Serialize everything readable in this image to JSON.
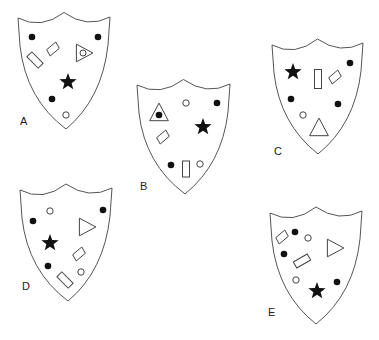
{
  "caption": "",
  "shields": [
    {
      "label": "A",
      "outline": {
        "tl": [
          18,
          18
        ],
        "tr": [
          110,
          17
        ],
        "tip": [
          66,
          129
        ]
      },
      "label_pos": [
        20,
        125
      ],
      "shapes": [
        {
          "type": "dot",
          "x": 32,
          "y": 37
        },
        {
          "type": "dot",
          "x": 98,
          "y": 37
        },
        {
          "type": "rect",
          "x": 35,
          "y": 60,
          "w": 16,
          "h": 7,
          "rot": 45
        },
        {
          "type": "diamond",
          "x": 53,
          "y": 49,
          "size": 7
        },
        {
          "type": "triangle-circle",
          "x": 83,
          "y": 53,
          "size": 11,
          "dir": "right"
        },
        {
          "type": "star",
          "x": 68,
          "y": 82,
          "r": 9
        },
        {
          "type": "dot",
          "x": 52,
          "y": 99
        },
        {
          "type": "circle",
          "x": 66,
          "y": 115
        }
      ]
    },
    {
      "label": "B",
      "outline": {
        "tl": [
          137,
          85
        ],
        "tr": [
          230,
          84
        ],
        "tip": [
          185,
          194
        ]
      },
      "label_pos": [
        140,
        190
      ],
      "shapes": [
        {
          "type": "triangle-dot",
          "x": 159,
          "y": 113,
          "size": 11,
          "dir": "up"
        },
        {
          "type": "circle",
          "x": 186,
          "y": 103
        },
        {
          "type": "dot",
          "x": 217,
          "y": 103
        },
        {
          "type": "star",
          "x": 203,
          "y": 127,
          "r": 9
        },
        {
          "type": "diamond",
          "x": 163,
          "y": 137,
          "size": 7
        },
        {
          "type": "dot",
          "x": 171,
          "y": 165
        },
        {
          "type": "rect",
          "x": 186,
          "y": 169,
          "w": 7,
          "h": 16,
          "rot": 0
        },
        {
          "type": "circle",
          "x": 200,
          "y": 164
        }
      ]
    },
    {
      "label": "C",
      "outline": {
        "tl": [
          272,
          45
        ],
        "tr": [
          363,
          43
        ],
        "tip": [
          318,
          154
        ]
      },
      "label_pos": [
        274,
        155
      ],
      "shapes": [
        {
          "type": "star",
          "x": 293,
          "y": 72,
          "r": 9
        },
        {
          "type": "rect",
          "x": 318,
          "y": 79,
          "w": 7,
          "h": 19,
          "rot": 0
        },
        {
          "type": "diamond",
          "x": 335,
          "y": 77,
          "size": 7
        },
        {
          "type": "dot",
          "x": 350,
          "y": 63
        },
        {
          "type": "dot",
          "x": 291,
          "y": 99
        },
        {
          "type": "dot",
          "x": 338,
          "y": 104
        },
        {
          "type": "circle",
          "x": 303,
          "y": 115
        },
        {
          "type": "triangle",
          "x": 319,
          "y": 128,
          "size": 11,
          "dir": "up"
        }
      ]
    },
    {
      "label": "D",
      "outline": {
        "tl": [
          20,
          190
        ],
        "tr": [
          112,
          188
        ],
        "tip": [
          68,
          301
        ]
      },
      "label_pos": [
        22,
        290
      ],
      "shapes": [
        {
          "type": "circle",
          "x": 50,
          "y": 211
        },
        {
          "type": "dot",
          "x": 103,
          "y": 210
        },
        {
          "type": "dot",
          "x": 33,
          "y": 221
        },
        {
          "type": "triangle",
          "x": 86,
          "y": 227,
          "size": 11,
          "dir": "right"
        },
        {
          "type": "star",
          "x": 50,
          "y": 243,
          "r": 9
        },
        {
          "type": "diamond",
          "x": 79,
          "y": 254,
          "size": 7
        },
        {
          "type": "dot",
          "x": 48,
          "y": 266
        },
        {
          "type": "rect",
          "x": 65,
          "y": 280,
          "w": 16,
          "h": 7,
          "rot": 45
        },
        {
          "type": "circle",
          "x": 81,
          "y": 272
        }
      ]
    },
    {
      "label": "E",
      "outline": {
        "tl": [
          270,
          213
        ],
        "tr": [
          362,
          211
        ],
        "tip": [
          316,
          324
        ]
      },
      "label_pos": [
        268,
        316
      ],
      "shapes": [
        {
          "type": "diamond",
          "x": 282,
          "y": 237,
          "size": 7
        },
        {
          "type": "dot",
          "x": 295,
          "y": 232
        },
        {
          "type": "circle",
          "x": 308,
          "y": 238
        },
        {
          "type": "triangle",
          "x": 334,
          "y": 248,
          "size": 11,
          "dir": "right"
        },
        {
          "type": "dot",
          "x": 284,
          "y": 254
        },
        {
          "type": "rect",
          "x": 302,
          "y": 261,
          "w": 16,
          "h": 7,
          "rot": -30
        },
        {
          "type": "circle",
          "x": 296,
          "y": 280
        },
        {
          "type": "star",
          "x": 317,
          "y": 291,
          "r": 9
        },
        {
          "type": "dot",
          "x": 337,
          "y": 282
        }
      ]
    }
  ]
}
